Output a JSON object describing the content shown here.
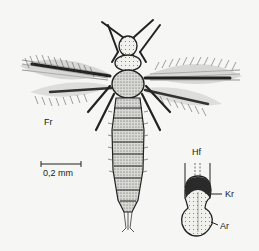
{
  "figure": {
    "labels": {
      "fringed_wing": "Fr",
      "scale": "0,2 mm",
      "foot_detail": "Hf",
      "claw": "Kr",
      "arolium": "Ar"
    },
    "colors": {
      "background": "#f6f6f4",
      "ink": "#222222",
      "shading": "#8a8a8a"
    }
  }
}
